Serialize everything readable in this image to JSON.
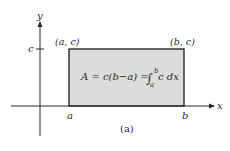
{
  "diagram": {
    "caption": "(a)",
    "axes": {
      "x_label": "x",
      "y_label": "y"
    },
    "tick_labels": {
      "y_tick": "c",
      "x_tick_a": "a",
      "x_tick_b": "b"
    },
    "corner_labels": {
      "top_left": "(a, c)",
      "top_right": "(b, c)"
    },
    "formula": {
      "lhs": "A = c(b−a) = ",
      "integral_sign": "∫",
      "upper_limit": "b",
      "lower_limit": "a",
      "integrand": "c dx"
    },
    "colors": {
      "region_fill": "#dcdcdc",
      "region_stroke": "#1a1a1a",
      "axis": "#2a2a2a"
    }
  }
}
